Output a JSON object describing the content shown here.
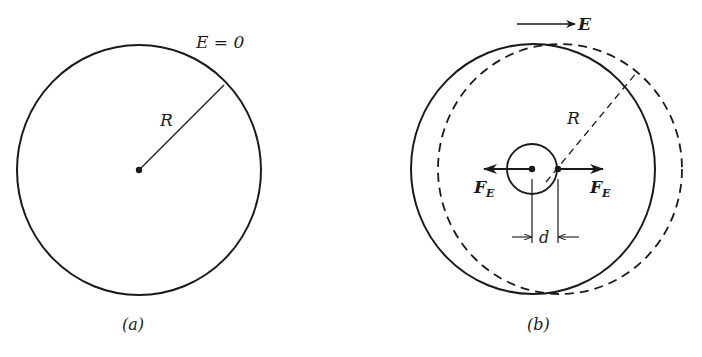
{
  "figure": {
    "panel_a": {
      "caption": "(a)",
      "field_label": "E = 0",
      "radius_label": "R"
    },
    "panel_b": {
      "caption": "(b)",
      "field_label": "E",
      "radius_label": "R",
      "force_left_label": "F",
      "force_left_sub": "E",
      "force_right_label": "F",
      "force_right_sub": "E",
      "displacement_label": "d"
    },
    "colors": {
      "ink": "#1a1a1a",
      "background": "#ffffff"
    }
  }
}
